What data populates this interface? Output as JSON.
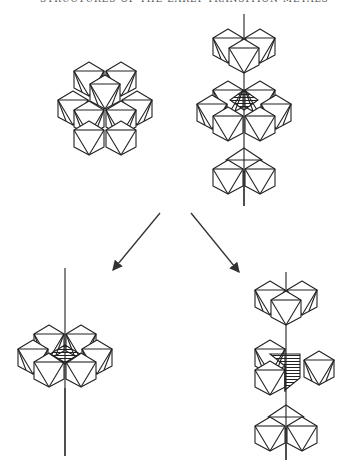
{
  "header": {
    "text": "STRUCTURES OF THE EARLY TRANSITION METALS"
  },
  "figure": {
    "panels": [
      {
        "id": "top-left",
        "label": "octahedral layer cluster (7 octahedra)"
      },
      {
        "id": "top-right",
        "label": "stacked layers along axis with shaded shared face"
      },
      {
        "id": "bottom-left",
        "label": "single layer with shaded central site on axis"
      },
      {
        "id": "bottom-right",
        "label": "chain of octahedral groups along axis with shaded shared faces"
      }
    ],
    "arrows": [
      {
        "from": "top",
        "to": "bottom-left"
      },
      {
        "from": "top",
        "to": "bottom-right"
      }
    ],
    "colors": {
      "line": "#222222",
      "background": "#ffffff"
    }
  }
}
